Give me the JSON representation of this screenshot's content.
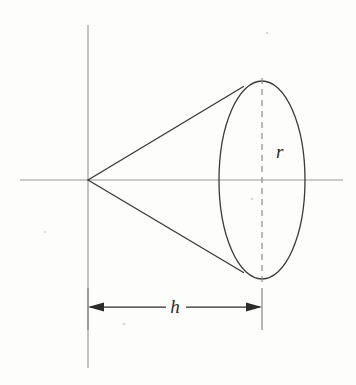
{
  "figure": {
    "background_color": "#fdfdfc",
    "ink_color": "#2b2b2b",
    "axis_color": "#9a9a9a",
    "dash_color": "#8b8b8b",
    "labels": {
      "radius": "r",
      "height": "h"
    },
    "geometry": {
      "apex": {
        "x": 88,
        "y": 180
      },
      "base_center": {
        "x": 262,
        "y": 180
      },
      "ellipse_rx": 43,
      "ellipse_ry": 99,
      "tangent_upper": {
        "x": 243,
        "y": 87
      },
      "tangent_lower": {
        "x": 243,
        "y": 272
      },
      "x_axis": {
        "x1": 20,
        "x2": 343,
        "y": 180
      },
      "y_axis": {
        "x": 88,
        "y1": 25,
        "y2": 368
      },
      "dimension_line_y": 307,
      "dimension_from_x": 88,
      "dimension_to_x": 262
    },
    "label_positions": {
      "radius": {
        "x": 276,
        "y": 158
      },
      "height": {
        "x": 175,
        "y": 313
      }
    }
  }
}
